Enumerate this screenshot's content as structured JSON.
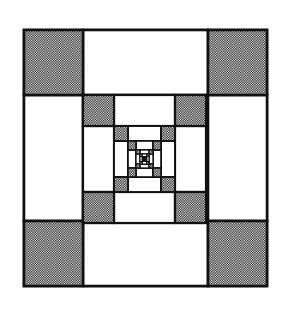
{
  "diagram": {
    "title": "",
    "type": "recursive-nested-squares",
    "colors": {
      "background": "#ffffff",
      "line": "#111111",
      "shade_dot": "#1a1a1a",
      "shade_bg": "#f4f4f4",
      "fill_white": "#ffffff"
    },
    "corner_fraction": 0.25,
    "levels": [
      {
        "level": 1,
        "x": 24,
        "y": 30,
        "w": 243,
        "h": 256,
        "stroke": 2.6
      },
      {
        "level": 2,
        "x": 83,
        "y": 95,
        "w": 123,
        "h": 128,
        "stroke": 2.2
      },
      {
        "level": 3,
        "x": 114,
        "y": 126,
        "w": 61,
        "h": 66,
        "stroke": 1.9
      },
      {
        "level": 4,
        "x": 128,
        "y": 141,
        "w": 33,
        "h": 36,
        "stroke": 1.6
      },
      {
        "level": 5,
        "x": 136,
        "y": 150,
        "w": 17,
        "h": 18,
        "stroke": 1.3
      },
      {
        "level": 6,
        "x": 140,
        "y": 154,
        "w": 9,
        "h": 10,
        "stroke": 1.0
      }
    ],
    "cell_roles": {
      "corners": "shaded",
      "edges": "white",
      "center": "next-level"
    }
  }
}
